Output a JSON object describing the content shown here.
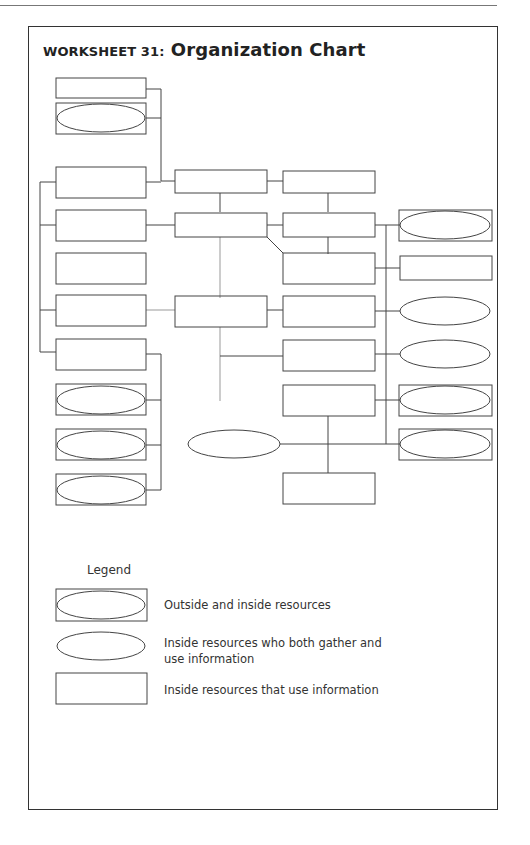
{
  "worksheet": {
    "label": "Worksheet 31:",
    "title": "Organization Chart"
  },
  "legend": {
    "title": "Legend",
    "items": [
      {
        "shape": "ellipse-in-rectangle",
        "label": "Outside and inside resources"
      },
      {
        "shape": "ellipse",
        "label": "Inside resources who both gather and use information"
      },
      {
        "shape": "rectangle",
        "label": "Inside resources that use information"
      }
    ]
  },
  "colors": {
    "line": "#444444",
    "background": "#ffffff"
  }
}
